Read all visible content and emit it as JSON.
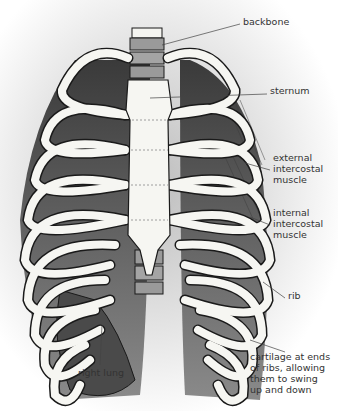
{
  "diagram": {
    "labels": [
      {
        "id": "backbone",
        "text": "backbone",
        "x": 243,
        "y": 21
      },
      {
        "id": "sternum",
        "text": "sternum",
        "x": 270,
        "y": 90
      },
      {
        "id": "external-intercostal-muscle",
        "text": "external\nintercostal\nmuscle",
        "x": 273,
        "y": 156
      },
      {
        "id": "internal-intercostal-muscle",
        "text": "internal\nintercostal\nmuscle",
        "x": 273,
        "y": 211
      },
      {
        "id": "rib",
        "text": "rib",
        "x": 287,
        "y": 294
      },
      {
        "id": "cartilage",
        "text": "cartilage at ends\nof ribs, allowing\nthem to swing\nup and down",
        "x": 250,
        "y": 353
      },
      {
        "id": "right-lung",
        "text": "right lung",
        "x": 78,
        "y": 369
      }
    ],
    "colors": {
      "bone": "#f6f6f2",
      "outline": "#1a1a1a",
      "shadow": "#555555",
      "leader_line": "#444444",
      "label_text": "#333333"
    }
  }
}
